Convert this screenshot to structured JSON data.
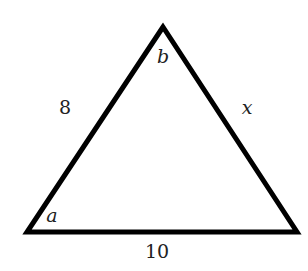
{
  "diagram": {
    "type": "triangle",
    "stroke_color": "#000000",
    "background": "#ffffff",
    "vertices": {
      "apex": [
        163,
        27
      ],
      "bottom_left": [
        27,
        232
      ],
      "bottom_right": [
        297,
        232
      ]
    },
    "angle_labels": {
      "apex": "b",
      "bottom_left": "a"
    },
    "side_labels": {
      "left": "8",
      "right": "x",
      "bottom": "10"
    }
  }
}
